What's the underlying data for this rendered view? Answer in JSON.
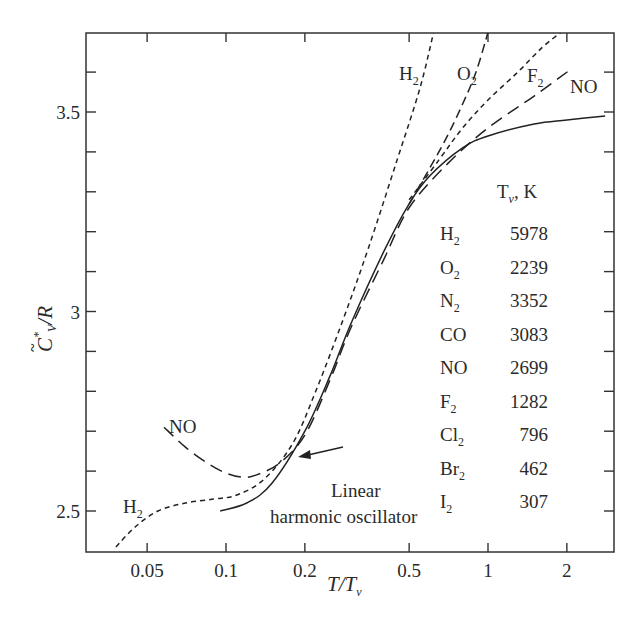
{
  "chart_data": {
    "type": "line",
    "title": "",
    "xlabel": "T/T_v",
    "ylabel": "C_V*/R",
    "xscale": "log",
    "xlim": [
      0.035,
      2.8
    ],
    "ylim": [
      2.4,
      3.7
    ],
    "grid": false,
    "x_ticks": [
      {
        "value": 0.05,
        "label": "0.05"
      },
      {
        "value": 0.1,
        "label": "0.1"
      },
      {
        "value": 0.2,
        "label": "0.2"
      },
      {
        "value": 0.5,
        "label": "0.5"
      },
      {
        "value": 1,
        "label": "1"
      },
      {
        "value": 2,
        "label": "2"
      }
    ],
    "y_ticks": [
      {
        "value": 2.5,
        "label": "2.5"
      },
      {
        "value": 3,
        "label": "3"
      },
      {
        "value": 3.5,
        "label": "3.5"
      }
    ],
    "series": [
      {
        "name": "Linear harmonic oscillator",
        "style": "solid",
        "x": [
          0.095,
          0.12,
          0.15,
          0.2,
          0.25,
          0.3,
          0.4,
          0.5,
          0.6,
          0.8,
          1.0,
          1.5,
          2.0,
          2.8
        ],
        "y": [
          2.5,
          2.52,
          2.57,
          2.7,
          2.84,
          2.97,
          3.15,
          3.27,
          3.34,
          3.41,
          3.44,
          3.47,
          3.48,
          3.49
        ]
      },
      {
        "name": "H2",
        "style": "short-dash",
        "x": [
          0.038,
          0.045,
          0.055,
          0.07,
          0.09,
          0.11,
          0.14,
          0.18,
          0.22,
          0.28,
          0.35,
          0.45,
          0.55,
          0.62
        ],
        "y": [
          2.41,
          2.46,
          2.5,
          2.52,
          2.53,
          2.54,
          2.58,
          2.67,
          2.8,
          2.98,
          3.16,
          3.38,
          3.56,
          3.7
        ]
      },
      {
        "name": "O2",
        "style": "dash",
        "x": [
          0.5,
          0.6,
          0.7,
          0.8,
          0.9,
          1.0
        ],
        "y": [
          3.27,
          3.36,
          3.44,
          3.52,
          3.6,
          3.7
        ]
      },
      {
        "name": "F2",
        "style": "short-dash",
        "x": [
          0.5,
          0.65,
          0.8,
          1.0,
          1.3,
          1.6,
          1.9
        ],
        "y": [
          3.28,
          3.38,
          3.46,
          3.53,
          3.6,
          3.66,
          3.7
        ]
      },
      {
        "name": "NO",
        "style": "long-dash",
        "x": [
          0.058,
          0.07,
          0.085,
          0.1,
          0.115,
          0.13,
          0.16,
          0.2,
          0.25,
          0.3,
          0.4,
          0.5,
          0.7,
          1.0,
          1.5,
          2.1
        ],
        "y": [
          2.71,
          2.66,
          2.62,
          2.595,
          2.585,
          2.59,
          2.62,
          2.69,
          2.83,
          2.96,
          3.13,
          3.26,
          3.37,
          3.46,
          3.54,
          3.61
        ]
      }
    ],
    "annotations": [
      {
        "text": "H2",
        "x": 0.36,
        "y": 3.62
      },
      {
        "text": "O2",
        "x": 0.66,
        "y": 3.62
      },
      {
        "text": "F2",
        "x": 1.15,
        "y": 3.6
      },
      {
        "text": "NO",
        "x": 2.1,
        "y": 3.57
      },
      {
        "text": "NO",
        "x": 0.065,
        "y": 2.71
      },
      {
        "text": "H2",
        "x": 0.045,
        "y": 2.5
      },
      {
        "text": "Linear harmonic oscillator",
        "x": 0.33,
        "y": 2.52,
        "arrow_to": [
          0.19,
          2.65
        ]
      }
    ],
    "legend_table": {
      "header": "T_v, K",
      "rows": [
        {
          "species": "H2",
          "Tv": 5978
        },
        {
          "species": "O2",
          "Tv": 2239
        },
        {
          "species": "N2",
          "Tv": 3352
        },
        {
          "species": "CO",
          "Tv": 3083
        },
        {
          "species": "NO",
          "Tv": 2699
        },
        {
          "species": "F2",
          "Tv": 1282
        },
        {
          "species": "Cl2",
          "Tv": 796
        },
        {
          "species": "Br2",
          "Tv": 462
        },
        {
          "species": "I2",
          "Tv": 307
        }
      ],
      "position": "right-center inside plot"
    }
  },
  "labels": {
    "y_main": "C",
    "y_tilde": "~",
    "y_star": "*",
    "y_sub": "V",
    "y_rest": "/R",
    "x_main": "T/T",
    "x_sub": "ν",
    "legend_header_main": "T",
    "legend_header_sub": "ν",
    "legend_header_rest": ", K",
    "linear_line1": "Linear",
    "linear_line2": "harmonic oscillator",
    "curve_H2_top": "H",
    "curve_O2_top": "O",
    "curve_F2_top": "F",
    "curve_NO_top": "NO",
    "curve_NO_left": "NO",
    "curve_H2_left": "H",
    "sub2": "2"
  },
  "legend_rows": [
    {
      "base": "H",
      "sub": "2",
      "value": "5978"
    },
    {
      "base": "O",
      "sub": "2",
      "value": "2239"
    },
    {
      "base": "N",
      "sub": "2",
      "value": "3352"
    },
    {
      "base": "CO",
      "sub": "",
      "value": "3083"
    },
    {
      "base": "NO",
      "sub": "",
      "value": "2699"
    },
    {
      "base": "F",
      "sub": "2",
      "value": "1282"
    },
    {
      "base": "Cl",
      "sub": "2",
      "value": "796"
    },
    {
      "base": "Br",
      "sub": "2",
      "value": "462"
    },
    {
      "base": "I",
      "sub": "2",
      "value": "307"
    }
  ]
}
